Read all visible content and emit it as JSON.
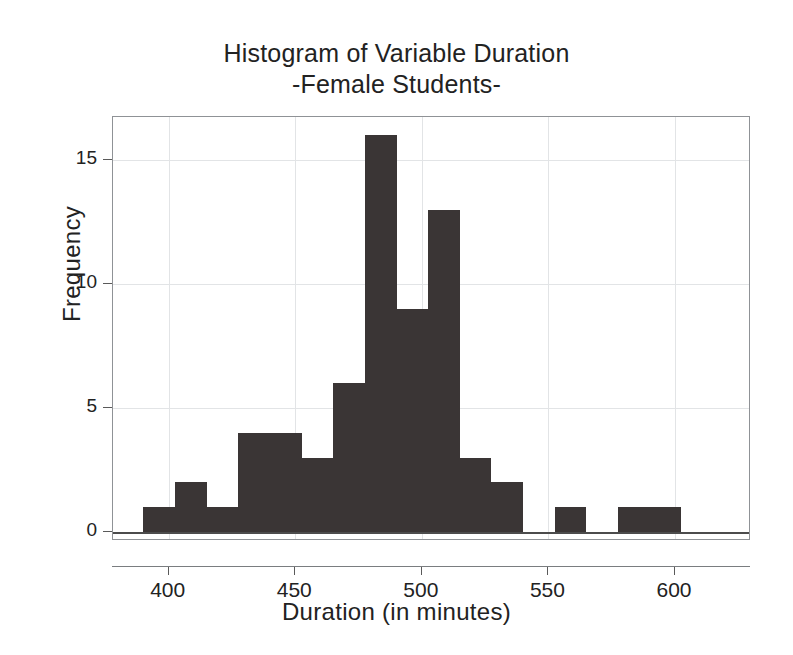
{
  "chart_data": {
    "type": "bar",
    "title": "Histogram of Variable Duration",
    "subtitle": "-Female Students-",
    "xlabel": "Duration (in minutes)",
    "ylabel": "Frequency",
    "xlim": [
      378,
      630
    ],
    "ylim": [
      0,
      17
    ],
    "grid": true,
    "legend": null,
    "bar_color": "#3a3535",
    "bin_width": 12.5,
    "xticks": [
      400,
      450,
      500,
      550,
      600
    ],
    "yticks": [
      0,
      5,
      10,
      15
    ],
    "bins": [
      {
        "start": 390.0,
        "end": 402.5,
        "value": 1
      },
      {
        "start": 402.5,
        "end": 415.0,
        "value": 2
      },
      {
        "start": 415.0,
        "end": 427.5,
        "value": 1
      },
      {
        "start": 427.5,
        "end": 440.0,
        "value": 4
      },
      {
        "start": 440.0,
        "end": 452.5,
        "value": 4
      },
      {
        "start": 452.5,
        "end": 465.0,
        "value": 3
      },
      {
        "start": 465.0,
        "end": 477.5,
        "value": 6
      },
      {
        "start": 477.5,
        "end": 490.0,
        "value": 16
      },
      {
        "start": 490.0,
        "end": 502.5,
        "value": 9
      },
      {
        "start": 502.5,
        "end": 515.0,
        "value": 13
      },
      {
        "start": 515.0,
        "end": 527.5,
        "value": 3
      },
      {
        "start": 527.5,
        "end": 540.0,
        "value": 2
      },
      {
        "start": 540.0,
        "end": 552.5,
        "value": 0
      },
      {
        "start": 552.5,
        "end": 565.0,
        "value": 1
      },
      {
        "start": 565.0,
        "end": 577.5,
        "value": 0
      },
      {
        "start": 577.5,
        "end": 590.0,
        "value": 1
      },
      {
        "start": 590.0,
        "end": 602.5,
        "value": 1
      }
    ],
    "categories": [
      "390-402.5",
      "402.5-415",
      "415-427.5",
      "427.5-440",
      "440-452.5",
      "452.5-465",
      "465-477.5",
      "477.5-490",
      "490-502.5",
      "502.5-515",
      "515-527.5",
      "527.5-540",
      "540-552.5",
      "552.5-565",
      "565-577.5",
      "577.5-590",
      "590-602.5"
    ],
    "values": [
      1,
      2,
      1,
      4,
      4,
      3,
      6,
      16,
      9,
      13,
      3,
      2,
      0,
      1,
      0,
      1,
      1
    ]
  }
}
